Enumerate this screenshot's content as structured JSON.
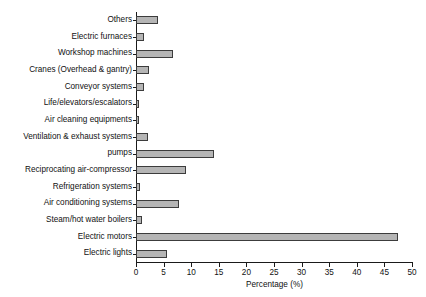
{
  "chart_data": {
    "type": "bar",
    "orientation": "horizontal",
    "title": "",
    "xlabel": "Percentage (%)",
    "ylabel": "",
    "xlim": [
      0,
      50
    ],
    "xticks": [
      0,
      5,
      10,
      15,
      20,
      25,
      30,
      35,
      40,
      45,
      50
    ],
    "grid": false,
    "legend": null,
    "bar_color": "#b5b5b5",
    "bar_edge_color": "#3c3c3c",
    "categories": [
      "Others",
      "Electric furnaces",
      "Workshop machines",
      "Cranes (Overhead & gantry)",
      "Conveyor systems",
      "Life/elevators/escalators",
      "Air cleaning equipments",
      "Ventilation & exhaust systems",
      "pumps",
      "Reciprocating air-compressor",
      "Refrigeration systems",
      "Air conditioning systems",
      "Steam/hot water boilers",
      "Electric motors",
      "Electric lights"
    ],
    "values": [
      3.9,
      1.4,
      6.7,
      2.4,
      1.5,
      0.5,
      0.5,
      2.2,
      14.2,
      9.1,
      0.8,
      7.8,
      1.1,
      47.5,
      5.6
    ]
  }
}
